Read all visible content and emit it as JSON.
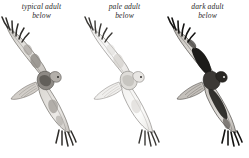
{
  "plate": {
    "title": "Red-tailed Hawk adult plumage variation, ventral view",
    "background_color": "#ffffff",
    "ink_color": "#2b2b2b",
    "layout": "three side-by-side flight illustrations, labels above each"
  },
  "figures": [
    {
      "id": "typical-adult-below",
      "caption_line1": "typical adult",
      "caption_line2": "below",
      "subject": "red-tailed-hawk-in-flight-ventral",
      "tone": "medium",
      "body_fill": "#b8b4ae",
      "wing_fill": "#d6d3ce",
      "mark_fill": "#6e6a64",
      "dark_fill": "#3f3c38",
      "wingtip_fill": "#2f2d2a"
    },
    {
      "id": "pale-adult-below",
      "caption_line1": "pale adult",
      "caption_line2": "below",
      "subject": "red-tailed-hawk-in-flight-ventral",
      "tone": "pale",
      "body_fill": "#e4e2de",
      "wing_fill": "#f2f1ef",
      "mark_fill": "#cbc8c3",
      "dark_fill": "#8d8a85",
      "wingtip_fill": "#3a3835"
    },
    {
      "id": "dark-adult-below",
      "caption_line1": "dark adult",
      "caption_line2": "below",
      "subject": "red-tailed-hawk-in-flight-ventral",
      "tone": "dark",
      "body_fill": "#9c9892",
      "wing_fill": "#cac7c2",
      "mark_fill": "#55514c",
      "dark_fill": "#1c1b19",
      "wingtip_fill": "#141312"
    }
  ]
}
